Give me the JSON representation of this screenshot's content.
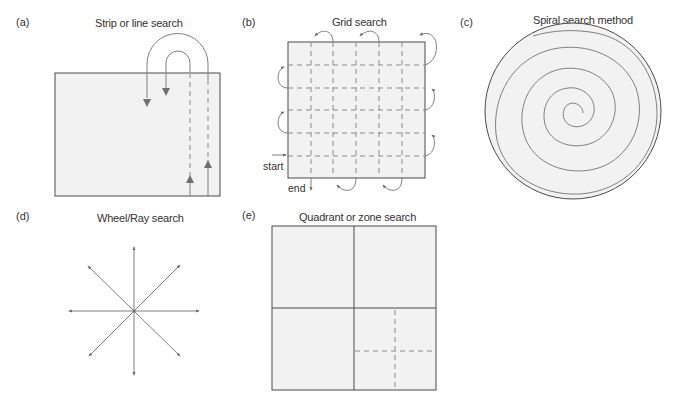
{
  "figure": {
    "panels": [
      {
        "id": "a",
        "label": "(a)",
        "title": "Strip or line search"
      },
      {
        "id": "b",
        "label": "(b)",
        "title": "Grid search",
        "start_label": "start",
        "end_label": "end"
      },
      {
        "id": "c",
        "label": "(c)",
        "title": "Spiral search method"
      },
      {
        "id": "d",
        "label": "(d)",
        "title": "Wheel/Ray search"
      },
      {
        "id": "e",
        "label": "(e)",
        "title": "Quadrant or zone search"
      }
    ],
    "colors": {
      "fill": "#f2f2f2",
      "border": "#4a4a4a",
      "path": "#777777",
      "dashed": "#8a8a8a"
    }
  }
}
